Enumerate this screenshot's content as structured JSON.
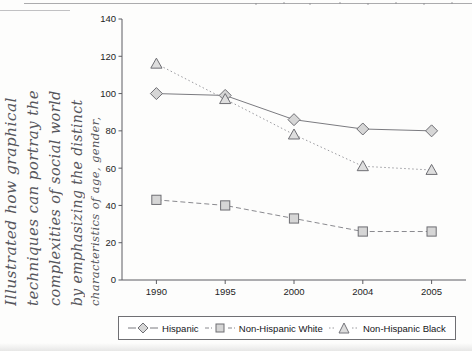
{
  "page": {
    "annotation_lines": [
      "Illustrated how graphical",
      "techniques can portray the",
      "complexities of social world",
      "by emphasizing the distinct",
      "characteristics of age, gender,"
    ]
  },
  "colors": {
    "axis": "#5d5d62",
    "series_hispanic": "#7b7b80",
    "series_white": "#8a8a8f",
    "series_black": "#9a9a9f",
    "marker_fill": "#d6d6d6",
    "text": "#16161a",
    "background": "#fdfdfc"
  },
  "chart_data": {
    "type": "line",
    "title": "",
    "xlabel": "",
    "ylabel": "",
    "categories": [
      "1990",
      "1995",
      "2000",
      "2004",
      "2005"
    ],
    "ylim": [
      0,
      140
    ],
    "yticks": [
      0,
      20,
      40,
      60,
      80,
      100,
      120,
      140
    ],
    "ytick_labels": [
      "0",
      "20",
      "40",
      "60",
      "80",
      "100",
      "120",
      "140"
    ],
    "grid": false,
    "legend_position": "bottom",
    "series": [
      {
        "name": "Hispanic",
        "marker": "diamond",
        "line_style": "solid",
        "values": [
          100,
          99,
          86,
          81,
          80
        ]
      },
      {
        "name": "Non-Hispanic White",
        "marker": "square",
        "line_style": "dashed",
        "values": [
          43,
          40,
          33,
          26,
          26
        ]
      },
      {
        "name": "Non-Hispanic Black",
        "marker": "triangle",
        "line_style": "dotted",
        "values": [
          116,
          97,
          78,
          61,
          59
        ]
      }
    ]
  }
}
